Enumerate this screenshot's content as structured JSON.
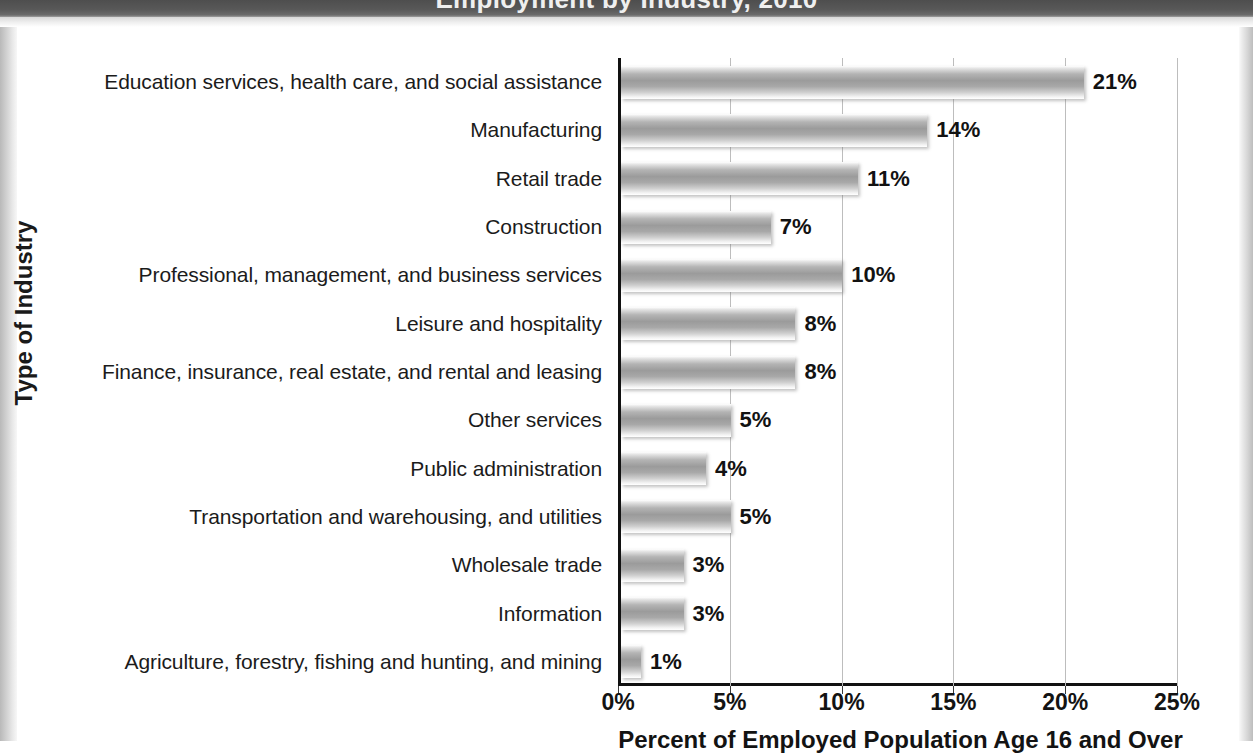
{
  "frame": {
    "title_cropped": "Employment by Industry, 2010"
  },
  "chart_data": {
    "type": "bar",
    "orientation": "horizontal",
    "title": "Employment by Industry, 2010",
    "xlabel": "Percent of Employed Population Age 16 and Over",
    "ylabel": "Type of Industry",
    "xlim": [
      0,
      25
    ],
    "xticks": [
      "0%",
      "5%",
      "10%",
      "15%",
      "20%",
      "25%"
    ],
    "xtick_values": [
      0,
      5,
      10,
      15,
      20,
      25
    ],
    "grid": "vertical",
    "legend": "none",
    "categories": [
      "Education services, health care, and social assistance",
      "Manufacturing",
      "Retail trade",
      "Construction",
      "Professional, management, and business services",
      "Leisure and hospitality",
      "Finance, insurance, real estate, and rental and leasing",
      "Other services",
      "Public administration",
      "Transportation and warehousing, and utilities",
      "Wholesale trade",
      "Information",
      "Agriculture, forestry, fishing and hunting, and mining"
    ],
    "values": [
      20.7,
      13.7,
      10.6,
      6.7,
      9.9,
      7.8,
      7.8,
      4.9,
      3.8,
      4.9,
      2.8,
      2.8,
      0.9
    ],
    "data_labels": [
      "21%",
      "14%",
      "11%",
      "7%",
      "10%",
      "8%",
      "8%",
      "5%",
      "4%",
      "5%",
      "3%",
      "3%",
      "1%"
    ],
    "bar_color": "#9b9b9b",
    "grid_color": "#bdbdbd",
    "axis_color": "#111111"
  }
}
